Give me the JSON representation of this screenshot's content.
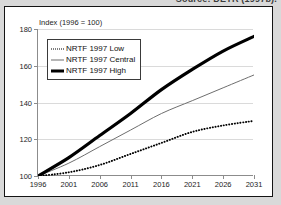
{
  "source": {
    "caption": "Source: DETR (1997b)."
  },
  "chart_data": {
    "type": "line",
    "title": "",
    "axis_note": "Index (1996 = 100)",
    "xlabel": "",
    "ylabel": "Index (1996 = 100)",
    "xlim": [
      1996,
      2031
    ],
    "ylim": [
      100,
      180
    ],
    "yticks": [
      100,
      120,
      140,
      160,
      180
    ],
    "xticks": [
      1996,
      2001,
      2006,
      2011,
      2016,
      2021,
      2026,
      2031
    ],
    "grid": "horizontal",
    "legend_position": "top-left",
    "x": [
      1996,
      2001,
      2006,
      2011,
      2016,
      2021,
      2026,
      2031
    ],
    "series": [
      {
        "name": "NRTF 1997 Low",
        "style": "dotted",
        "color": "#000000",
        "values": [
          100,
          102,
          106,
          112,
          118,
          124,
          127.5,
          130
        ]
      },
      {
        "name": "NRTF 1997 Central",
        "style": "thin",
        "color": "#6e6e6e",
        "values": [
          100,
          107,
          116,
          125,
          134,
          141,
          148,
          155
        ]
      },
      {
        "name": "NRTF 1997 High",
        "style": "thick",
        "color": "#000000",
        "values": [
          100,
          110,
          122,
          134,
          147,
          158,
          168,
          176
        ]
      }
    ]
  },
  "legend": {
    "items": [
      {
        "label": "NRTF 1997 Low"
      },
      {
        "label": "NRTF 1997 Central"
      },
      {
        "label": "NRTF 1997 High"
      }
    ]
  }
}
